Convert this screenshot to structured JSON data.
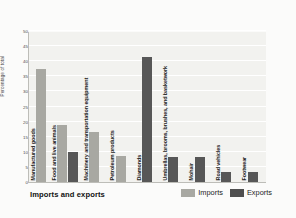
{
  "chart_data": {
    "type": "bar",
    "title": "Imports and exports",
    "xlabel": "",
    "ylabel": "Percentage of total",
    "ylim": [
      0,
      50
    ],
    "yticks": [
      0,
      5,
      10,
      15,
      20,
      25,
      30,
      35,
      40,
      45,
      50
    ],
    "grid": true,
    "legend_position": "bottom-right",
    "categories": [
      "Manufactured goods",
      "Food and live animals",
      "Machinery and transportation equipment",
      "Petroleum products",
      "Diamonds",
      "Umbrellas, brooms, brushes, and basketwork",
      "Mohair",
      "Road vehicles",
      "Footwear"
    ],
    "series": [
      {
        "name": "Imports",
        "color": "#a8a8a2",
        "values": [
          37.3,
          18.8,
          16.7,
          8.7,
          null,
          null,
          null,
          null,
          null
        ]
      },
      {
        "name": "Exports",
        "color": "#4f4f4f",
        "values": [
          null,
          9.8,
          null,
          null,
          41.5,
          8.3,
          8.3,
          3.2,
          3.2
        ]
      }
    ]
  },
  "legend": {
    "imports_label": "Imports",
    "exports_label": "Exports"
  }
}
